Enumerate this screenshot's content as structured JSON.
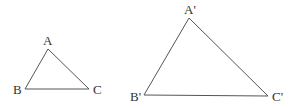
{
  "diagram": {
    "stroke_color": "#555555",
    "label_color": "#333333",
    "triangles": [
      {
        "name": "ABC",
        "vertices": {
          "A": {
            "label": "A",
            "x": 48,
            "y": 49
          },
          "B": {
            "label": "B",
            "x": 25,
            "y": 89
          },
          "C": {
            "label": "C",
            "x": 89,
            "y": 89
          }
        }
      },
      {
        "name": "A'B'C'",
        "vertices": {
          "A": {
            "label": "A'",
            "x": 189,
            "y": 18
          },
          "B": {
            "label": "B'",
            "x": 144,
            "y": 95
          },
          "C": {
            "label": "C'",
            "x": 268,
            "y": 96
          }
        }
      }
    ]
  }
}
